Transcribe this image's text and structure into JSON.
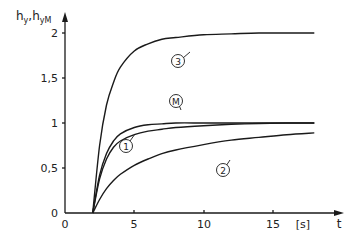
{
  "chart_data": {
    "type": "line",
    "title": "",
    "xlabel": "t",
    "xunit": "[s]",
    "ylabel": "h_y, h_yM",
    "xlim": [
      0,
      18.5
    ],
    "ylim": [
      0,
      2.1
    ],
    "grid": false,
    "legend": "inline circled labels",
    "x_ticks": [
      "0",
      "5",
      "10",
      "15"
    ],
    "y_ticks": [
      "0",
      "0,5",
      "1",
      "1,5",
      "2"
    ],
    "x": [
      2,
      2.5,
      3,
      3.5,
      4,
      5,
      6,
      7,
      8,
      10,
      12,
      14,
      16,
      18
    ],
    "series": [
      {
        "name": "M",
        "label": "M",
        "values": [
          0,
          0.42,
          0.66,
          0.8,
          0.88,
          0.95,
          0.98,
          0.99,
          1.0,
          1.0,
          1.0,
          1.0,
          1.0,
          1.0
        ]
      },
      {
        "name": "1",
        "label": "1",
        "values": [
          0,
          0.38,
          0.6,
          0.73,
          0.8,
          0.87,
          0.91,
          0.93,
          0.95,
          0.97,
          0.985,
          0.995,
          1.0,
          1.0
        ]
      },
      {
        "name": "2",
        "label": "2",
        "values": [
          0,
          0.15,
          0.27,
          0.36,
          0.43,
          0.53,
          0.6,
          0.66,
          0.7,
          0.76,
          0.81,
          0.84,
          0.87,
          0.89
        ]
      },
      {
        "name": "3",
        "label": "3",
        "values": [
          0,
          0.75,
          1.2,
          1.45,
          1.62,
          1.8,
          1.88,
          1.93,
          1.95,
          1.98,
          1.99,
          2.0,
          2.0,
          2.0
        ]
      }
    ],
    "annotations": [
      {
        "text": "3",
        "at_t": 8.2,
        "at_y": 1.72
      },
      {
        "text": "M",
        "at_t": 8.0,
        "at_y": 1.17
      },
      {
        "text": "1",
        "at_t": 5.1,
        "at_y": 0.74
      },
      {
        "text": "2",
        "at_t": 11.4,
        "at_y": 0.48
      }
    ]
  },
  "labels": {
    "y_axis_main": "h",
    "y_axis_sub1": "y",
    "y_axis_sep": ",",
    "y_axis_main2": "h",
    "y_axis_sub2": "yM",
    "x_axis": "t",
    "x_unit": "[s]",
    "x_ticks": [
      "0",
      "5",
      "10",
      "15"
    ],
    "y_ticks": [
      "0",
      "0,5",
      "1",
      "1,5",
      "2"
    ],
    "markers": [
      "3",
      "M",
      "1",
      "2"
    ]
  },
  "colors": {
    "line": "#1a1a1a",
    "axis": "#1a1a1a",
    "background": "#ffffff"
  }
}
